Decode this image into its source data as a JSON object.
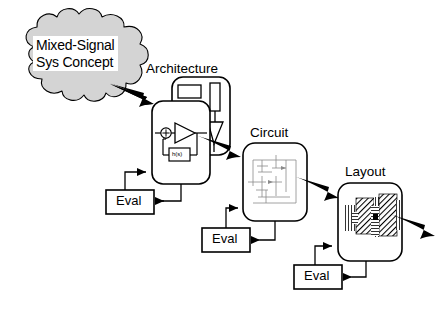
{
  "diagram": {
    "title_concept_line1": "Mixed-Signal",
    "title_concept_line2": "Sys Concept",
    "stages": [
      {
        "id": "architecture",
        "label": "Architecture"
      },
      {
        "id": "circuit",
        "label": "Circuit"
      },
      {
        "id": "layout",
        "label": "Layout"
      }
    ],
    "eval_boxes": [
      {
        "id": "eval-architecture",
        "label": "Eval"
      },
      {
        "id": "eval-circuit",
        "label": "Eval"
      },
      {
        "id": "eval-layout",
        "label": "Eval"
      }
    ],
    "architecture_block": {
      "feedback_label": "h(s)",
      "summing_node_symbol": "+"
    },
    "colors": {
      "cloud_fill": "#d4d4d4",
      "stroke": "#000000",
      "background": "#ffffff",
      "circuit_schematic": "#8a8a8a",
      "layout_hatch": "#000000"
    }
  }
}
